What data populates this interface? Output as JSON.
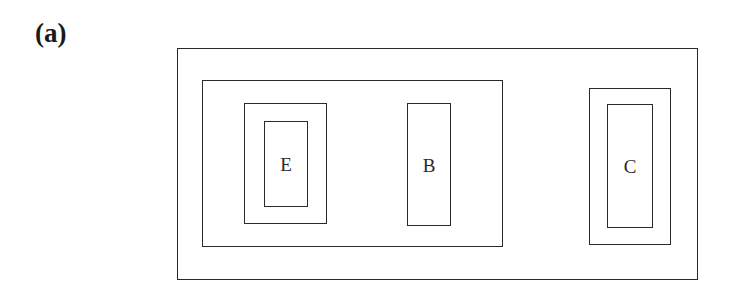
{
  "figure": {
    "panel_label": "(a)",
    "boxes": {
      "outer": {
        "label": ""
      },
      "group": {
        "label": ""
      },
      "e_outer": {
        "label": ""
      },
      "e_inner": {
        "label": "E"
      },
      "b": {
        "label": "B"
      },
      "c_outer": {
        "label": ""
      },
      "c_inner": {
        "label": "C"
      }
    }
  }
}
